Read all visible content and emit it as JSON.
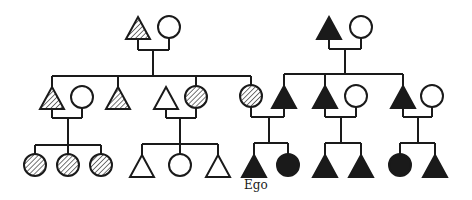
{
  "diagram": {
    "type": "kinship-pedigree",
    "legend_fills": {
      "hatched": "hatch",
      "filled": "#1a1a1a",
      "open": "#ffffff"
    },
    "ego_label": "Ego",
    "individuals": [
      {
        "id": "g1-pgf",
        "sex": "male",
        "fill": "hatched",
        "x": 138,
        "y": 28
      },
      {
        "id": "g1-pgm",
        "sex": "female",
        "fill": "open",
        "x": 169,
        "y": 27
      },
      {
        "id": "g1-mgf",
        "sex": "male",
        "fill": "filled",
        "x": 329,
        "y": 28
      },
      {
        "id": "g1-mgm",
        "sex": "female",
        "fill": "open",
        "x": 361,
        "y": 27
      },
      {
        "id": "g2-a",
        "sex": "male",
        "fill": "hatched",
        "x": 52,
        "y": 98
      },
      {
        "id": "g2-a-wife",
        "sex": "female",
        "fill": "open",
        "x": 82,
        "y": 97
      },
      {
        "id": "g2-b",
        "sex": "male",
        "fill": "hatched",
        "x": 118,
        "y": 98
      },
      {
        "id": "g2-c-husband",
        "sex": "male",
        "fill": "open",
        "x": 166,
        "y": 98
      },
      {
        "id": "g2-c",
        "sex": "female",
        "fill": "hatched",
        "x": 196,
        "y": 97
      },
      {
        "id": "g2-mother",
        "sex": "female",
        "fill": "hatched",
        "x": 251,
        "y": 96
      },
      {
        "id": "g2-father",
        "sex": "male",
        "fill": "filled",
        "x": 284,
        "y": 97
      },
      {
        "id": "g2-d",
        "sex": "male",
        "fill": "filled",
        "x": 325,
        "y": 97
      },
      {
        "id": "g2-d-wife",
        "sex": "female",
        "fill": "open",
        "x": 356,
        "y": 96
      },
      {
        "id": "g2-e",
        "sex": "male",
        "fill": "filled",
        "x": 403,
        "y": 97
      },
      {
        "id": "g2-e-wife",
        "sex": "female",
        "fill": "open",
        "x": 432,
        "y": 96
      },
      {
        "id": "g3-a1",
        "sex": "female",
        "fill": "hatched",
        "x": 35,
        "y": 165
      },
      {
        "id": "g3-a2",
        "sex": "female",
        "fill": "hatched",
        "x": 68,
        "y": 165
      },
      {
        "id": "g3-a3",
        "sex": "female",
        "fill": "hatched",
        "x": 101,
        "y": 165
      },
      {
        "id": "g3-c1",
        "sex": "male",
        "fill": "open",
        "x": 142,
        "y": 166
      },
      {
        "id": "g3-c2",
        "sex": "female",
        "fill": "open",
        "x": 180,
        "y": 165
      },
      {
        "id": "g3-c3",
        "sex": "male",
        "fill": "open",
        "x": 218,
        "y": 166
      },
      {
        "id": "g3-ego",
        "sex": "male",
        "fill": "filled",
        "x": 254,
        "y": 166,
        "label": "Ego"
      },
      {
        "id": "g3-sister",
        "sex": "female",
        "fill": "filled",
        "x": 288,
        "y": 165
      },
      {
        "id": "g3-d1",
        "sex": "male",
        "fill": "filled",
        "x": 325,
        "y": 166
      },
      {
        "id": "g3-d2",
        "sex": "male",
        "fill": "filled",
        "x": 361,
        "y": 166
      },
      {
        "id": "g3-e1",
        "sex": "female",
        "fill": "filled",
        "x": 400,
        "y": 165
      },
      {
        "id": "g3-e2",
        "sex": "male",
        "fill": "filled",
        "x": 435,
        "y": 166
      }
    ],
    "lines": [
      [
        138,
        39,
        138,
        50
      ],
      [
        169,
        38,
        169,
        50
      ],
      [
        138,
        50,
        169,
        50
      ],
      [
        153,
        50,
        153,
        76
      ],
      [
        52,
        76,
        251,
        76
      ],
      [
        52,
        76,
        52,
        87
      ],
      [
        118,
        76,
        118,
        87
      ],
      [
        196,
        76,
        196,
        86
      ],
      [
        251,
        76,
        251,
        85
      ],
      [
        329,
        39,
        329,
        49
      ],
      [
        361,
        38,
        361,
        49
      ],
      [
        329,
        49,
        361,
        49
      ],
      [
        345,
        49,
        345,
        74
      ],
      [
        284,
        74,
        403,
        74
      ],
      [
        284,
        74,
        284,
        86
      ],
      [
        325,
        74,
        325,
        86
      ],
      [
        403,
        74,
        403,
        86
      ],
      [
        52,
        109,
        52,
        118
      ],
      [
        82,
        108,
        82,
        118
      ],
      [
        52,
        118,
        82,
        118
      ],
      [
        68,
        118,
        68,
        145
      ],
      [
        35,
        145,
        101,
        145
      ],
      [
        35,
        145,
        35,
        154
      ],
      [
        68,
        145,
        68,
        154
      ],
      [
        101,
        145,
        101,
        154
      ],
      [
        166,
        109,
        166,
        118
      ],
      [
        196,
        108,
        196,
        118
      ],
      [
        166,
        118,
        196,
        118
      ],
      [
        180,
        118,
        180,
        144
      ],
      [
        142,
        144,
        218,
        144
      ],
      [
        142,
        144,
        142,
        155
      ],
      [
        180,
        144,
        180,
        154
      ],
      [
        218,
        144,
        218,
        155
      ],
      [
        251,
        107,
        251,
        117
      ],
      [
        284,
        108,
        284,
        117
      ],
      [
        251,
        117,
        284,
        117
      ],
      [
        269,
        117,
        269,
        143
      ],
      [
        254,
        143,
        288,
        143
      ],
      [
        254,
        143,
        254,
        155
      ],
      [
        288,
        143,
        288,
        154
      ],
      [
        325,
        108,
        325,
        117
      ],
      [
        356,
        107,
        356,
        117
      ],
      [
        325,
        117,
        356,
        117
      ],
      [
        341,
        117,
        341,
        143
      ],
      [
        325,
        143,
        361,
        143
      ],
      [
        325,
        143,
        325,
        155
      ],
      [
        361,
        143,
        361,
        155
      ],
      [
        403,
        108,
        403,
        117
      ],
      [
        432,
        107,
        432,
        117
      ],
      [
        403,
        117,
        432,
        117
      ],
      [
        418,
        117,
        418,
        143
      ],
      [
        400,
        143,
        435,
        143
      ],
      [
        400,
        143,
        400,
        154
      ],
      [
        435,
        143,
        435,
        155
      ]
    ],
    "ego_label_pos": {
      "x": 244,
      "y": 189
    }
  }
}
